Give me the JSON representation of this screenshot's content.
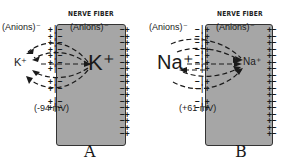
{
  "panels": [
    {
      "id": "A",
      "fiber_title": "NERVE FIBER",
      "anions_outside": "(Anions)⁻",
      "anions_inside": "(Anions)⁻",
      "ion_outside": "K⁺",
      "ion_inside": "K⁺",
      "potential": "(-94 mV)",
      "label": "A",
      "membrane_outer_charge": "+",
      "membrane_inner_charge": "−",
      "right_edge_inner_charge": "−",
      "right_edge_outer_charge": "+"
    },
    {
      "id": "B",
      "fiber_title": "NERVE FIBER",
      "anions_outside": "(Anions)⁻",
      "anions_inside": "(Anions)⁻",
      "ion_outside": "Na⁺",
      "ion_inside": "Na⁺",
      "potential": "(+61 mV)",
      "label": "B",
      "membrane_outer_charge": "−",
      "membrane_inner_charge": "+",
      "right_edge_inner_charge": "+",
      "right_edge_outer_charge": "−"
    }
  ],
  "colors": {
    "fiber_fill": "#a6a6a6",
    "ink": "#1a1a1a",
    "background": "#ffffff"
  }
}
